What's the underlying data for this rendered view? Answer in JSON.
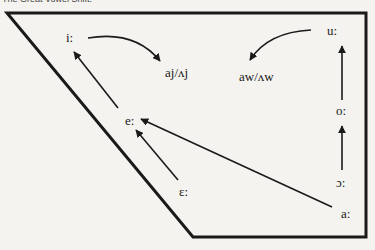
{
  "title": "The Great Vowel Shift.",
  "diagram": {
    "type": "vowel-trapezoid",
    "vowels": {
      "i": "i:",
      "e": "e:",
      "eps": "ɛ:",
      "a": "a:",
      "open_o": "ɔ:",
      "o": "o:",
      "u": "u:"
    },
    "diphthongs": {
      "front": "aj/ʌj",
      "back": "aw/ʌw"
    },
    "arrows": [
      {
        "from": "i:",
        "to": "aj/ʌj",
        "shape": "curved"
      },
      {
        "from": "u:",
        "to": "aw/ʌw",
        "shape": "curved"
      },
      {
        "from": "e:",
        "to": "i:",
        "shape": "straight"
      },
      {
        "from": "ɛ:",
        "to": "e:",
        "shape": "straight"
      },
      {
        "from": "a:",
        "to": "e:",
        "shape": "straight"
      },
      {
        "from": "o:",
        "to": "u:",
        "shape": "straight"
      },
      {
        "from": "ɔ:",
        "to": "o:",
        "shape": "straight"
      }
    ]
  }
}
